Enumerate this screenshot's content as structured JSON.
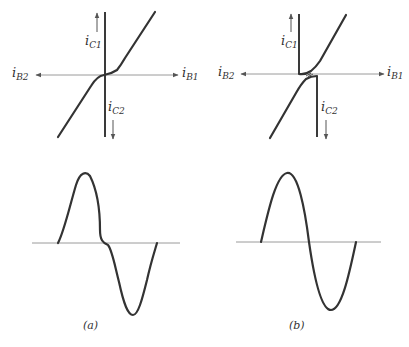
{
  "figure": {
    "panels": [
      {
        "id": "a",
        "caption": "(a)",
        "transfer": {
          "labels": {
            "ic1": {
              "main": "i",
              "sub": "C1"
            },
            "ic2": {
              "main": "i",
              "sub": "C2"
            },
            "ib1": {
              "main": "i",
              "sub": "B1"
            },
            "ib2": {
              "main": "i",
              "sub": "B2"
            }
          },
          "description": "Class B transfer characteristic with crossover dead zone near origin"
        },
        "waveform": {
          "description": "Output sine wave showing crossover distortion at zero crossing"
        }
      },
      {
        "id": "b",
        "caption": "(b)",
        "transfer": {
          "labels": {
            "ic1": {
              "main": "i",
              "sub": "C1"
            },
            "ic2": {
              "main": "i",
              "sub": "C2"
            },
            "ib1": {
              "main": "i",
              "sub": "B1"
            },
            "ib2": {
              "main": "i",
              "sub": "B2"
            }
          },
          "description": "Composite characteristic with offset curves (bias applied), linear overall"
        },
        "waveform": {
          "description": "Undistorted sine wave output"
        }
      }
    ]
  }
}
